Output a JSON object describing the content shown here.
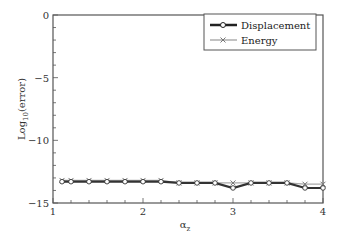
{
  "chart_data": {
    "type": "line",
    "title": "",
    "xlabel": "α",
    "xlabel_sub": "z",
    "ylabel": "Log",
    "ylabel_sub": "10",
    "ylabel_suffix": "(error)",
    "xlim": [
      1,
      4
    ],
    "ylim": [
      -15,
      0
    ],
    "xticks": [
      1,
      2,
      3,
      4
    ],
    "xtick_labels": [
      "1",
      "2",
      "3",
      "4"
    ],
    "yticks": [
      0,
      -5,
      -10,
      -15
    ],
    "ytick_labels": [
      "0",
      "−5",
      "−10",
      "−15"
    ],
    "x_minor_step": 0.2,
    "y_minor_step": 1,
    "grid": false,
    "legend_position": "top-right",
    "series": [
      {
        "name": "Displacement",
        "marker": "circle",
        "color": "#333333",
        "x": [
          1.1,
          1.2,
          1.4,
          1.6,
          1.8,
          2.0,
          2.2,
          2.4,
          2.6,
          2.8,
          3.0,
          3.2,
          3.4,
          3.6,
          3.8,
          4.0
        ],
        "values": [
          -13.3,
          -13.3,
          -13.3,
          -13.3,
          -13.3,
          -13.3,
          -13.3,
          -13.4,
          -13.4,
          -13.4,
          -13.8,
          -13.4,
          -13.4,
          -13.4,
          -13.8,
          -13.8
        ]
      },
      {
        "name": "Energy",
        "marker": "x",
        "color": "#999999",
        "x": [
          1.1,
          1.2,
          1.4,
          1.6,
          1.8,
          2.0,
          2.2,
          2.4,
          2.6,
          2.8,
          3.0,
          3.2,
          3.4,
          3.6,
          3.8,
          4.0
        ],
        "values": [
          -13.2,
          -13.2,
          -13.2,
          -13.2,
          -13.2,
          -13.2,
          -13.2,
          -13.4,
          -13.4,
          -13.4,
          -13.4,
          -13.4,
          -13.4,
          -13.4,
          -13.5,
          -13.5
        ]
      }
    ]
  }
}
